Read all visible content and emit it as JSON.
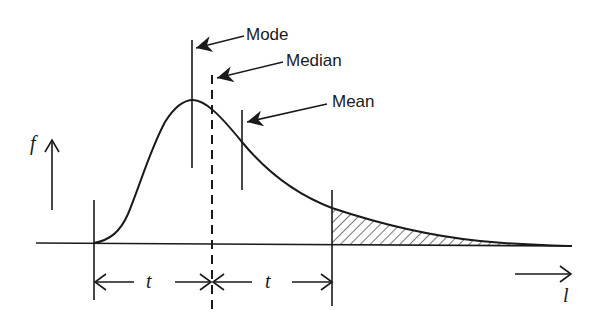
{
  "diagram": {
    "type": "right-skewed probability density curve",
    "labels": {
      "mode": "Mode",
      "median": "Median",
      "mean": "Mean",
      "y_axis": "f",
      "x_axis": "l",
      "interval_left": "t",
      "interval_right": "t"
    },
    "colors": {
      "ink": "#1a1a1a",
      "background": "#ffffff"
    }
  }
}
